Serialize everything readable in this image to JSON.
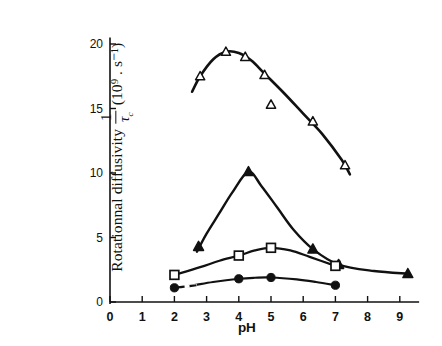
{
  "figure": {
    "y_axis_label_prefix": "Rotationnal diffusivity",
    "y_axis_fraction_numerator": "1",
    "y_axis_fraction_denominator": "τ",
    "y_axis_fraction_denominator_sub": "c",
    "y_axis_units": "(10⁹ . s⁻¹)",
    "x_axis_label": "pH",
    "background_color": "#ffffff",
    "ink_color": "#111111"
  },
  "chart_data": {
    "type": "line",
    "title": "",
    "subtitle": "",
    "xlabel": "pH",
    "ylabel": "Rotationnal diffusivity 1/τc (10⁹ . s⁻¹)",
    "xlim": [
      0,
      9.6
    ],
    "ylim": [
      0,
      20.5
    ],
    "xticks": [
      0,
      1,
      2,
      3,
      4,
      5,
      6,
      7,
      8,
      9
    ],
    "xticklabels": [
      "0",
      "1",
      "2",
      "3",
      "4",
      "5",
      "6",
      "7",
      "8",
      "9"
    ],
    "yticks": [
      0,
      5,
      10,
      15,
      20
    ],
    "yticklabels": [
      "0",
      "5",
      "10",
      "15",
      "20"
    ],
    "grid": false,
    "legend": "none",
    "series": [
      {
        "name": "open-triangle-series",
        "marker": "triangle-open",
        "points": [
          {
            "x": 2.8,
            "y": 17.5
          },
          {
            "x": 3.6,
            "y": 19.4
          },
          {
            "x": 4.2,
            "y": 19.0
          },
          {
            "x": 4.8,
            "y": 17.6
          },
          {
            "x": 5.0,
            "y": 15.3
          },
          {
            "x": 6.3,
            "y": 14.0
          },
          {
            "x": 7.3,
            "y": 10.6
          }
        ],
        "curve": [
          {
            "x": 2.55,
            "y": 16.3
          },
          {
            "x": 2.8,
            "y": 17.5
          },
          {
            "x": 3.2,
            "y": 18.8
          },
          {
            "x": 3.6,
            "y": 19.4
          },
          {
            "x": 4.0,
            "y": 19.3
          },
          {
            "x": 4.4,
            "y": 18.7
          },
          {
            "x": 4.8,
            "y": 17.7
          },
          {
            "x": 5.4,
            "y": 16.2
          },
          {
            "x": 6.0,
            "y": 14.6
          },
          {
            "x": 6.6,
            "y": 13.0
          },
          {
            "x": 7.2,
            "y": 11.0
          },
          {
            "x": 7.45,
            "y": 9.9
          }
        ]
      },
      {
        "name": "filled-triangle-series",
        "marker": "triangle-filled",
        "points": [
          {
            "x": 2.75,
            "y": 4.3
          },
          {
            "x": 4.3,
            "y": 10.1
          },
          {
            "x": 6.3,
            "y": 4.1
          },
          {
            "x": 7.1,
            "y": 2.9
          },
          {
            "x": 9.25,
            "y": 2.2
          }
        ],
        "curve": [
          {
            "x": 2.7,
            "y": 3.9
          },
          {
            "x": 3.0,
            "y": 5.3
          },
          {
            "x": 3.4,
            "y": 6.9
          },
          {
            "x": 3.8,
            "y": 8.5
          },
          {
            "x": 4.3,
            "y": 10.1
          },
          {
            "x": 4.7,
            "y": 9.0
          },
          {
            "x": 5.2,
            "y": 7.3
          },
          {
            "x": 5.7,
            "y": 5.6
          },
          {
            "x": 6.3,
            "y": 4.1
          },
          {
            "x": 7.1,
            "y": 2.9
          },
          {
            "x": 8.2,
            "y": 2.4
          },
          {
            "x": 9.25,
            "y": 2.2
          }
        ]
      },
      {
        "name": "open-square-series",
        "marker": "square-open",
        "points": [
          {
            "x": 2.0,
            "y": 2.1
          },
          {
            "x": 4.0,
            "y": 3.6
          },
          {
            "x": 5.0,
            "y": 4.2
          },
          {
            "x": 7.0,
            "y": 2.8
          }
        ],
        "curve": [
          {
            "x": 2.0,
            "y": 2.1
          },
          {
            "x": 2.8,
            "y": 2.7
          },
          {
            "x": 3.4,
            "y": 3.2
          },
          {
            "x": 4.0,
            "y": 3.6
          },
          {
            "x": 4.5,
            "y": 4.0
          },
          {
            "x": 5.0,
            "y": 4.2
          },
          {
            "x": 5.6,
            "y": 4.0
          },
          {
            "x": 6.2,
            "y": 3.5
          },
          {
            "x": 7.0,
            "y": 2.8
          }
        ]
      },
      {
        "name": "filled-circle-series",
        "marker": "circle-filled",
        "points": [
          {
            "x": 2.0,
            "y": 1.1
          },
          {
            "x": 4.0,
            "y": 1.8
          },
          {
            "x": 5.0,
            "y": 1.9
          },
          {
            "x": 7.0,
            "y": 1.3
          }
        ],
        "curve": [
          {
            "x": 2.0,
            "y": 1.1
          },
          {
            "x": 2.5,
            "y": 1.25
          },
          {
            "x": 3.2,
            "y": 1.55
          },
          {
            "x": 4.0,
            "y": 1.8
          },
          {
            "x": 4.5,
            "y": 1.88
          },
          {
            "x": 5.0,
            "y": 1.9
          },
          {
            "x": 5.8,
            "y": 1.75
          },
          {
            "x": 6.4,
            "y": 1.55
          },
          {
            "x": 7.0,
            "y": 1.3
          }
        ],
        "dashed_segment": [
          {
            "x": 2.1,
            "y": 1.13
          },
          {
            "x": 2.7,
            "y": 1.3
          }
        ]
      }
    ]
  }
}
